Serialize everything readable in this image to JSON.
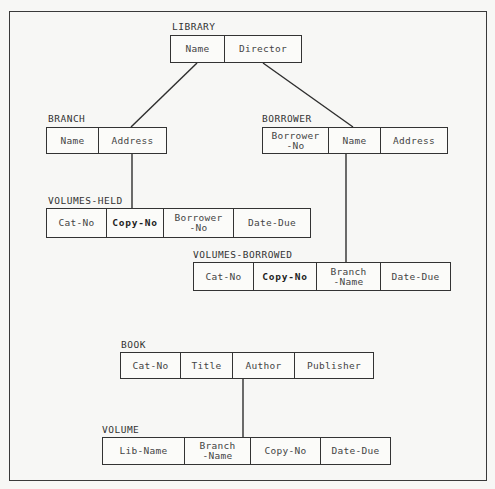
{
  "diagram": {
    "type": "hierarchical relational schema",
    "relations": {
      "library": {
        "name": "LIBRARY",
        "attributes": [
          {
            "label": "Name",
            "key": false
          },
          {
            "label": "Director",
            "key": false
          }
        ]
      },
      "branch": {
        "name": "BRANCH",
        "attributes": [
          {
            "label": "Name",
            "key": false
          },
          {
            "label": "Address",
            "key": false
          }
        ]
      },
      "borrower": {
        "name": "BORROWER",
        "attributes": [
          {
            "label": "Borrower\n-No",
            "key": false
          },
          {
            "label": "Name",
            "key": false
          },
          {
            "label": "Address",
            "key": false
          }
        ]
      },
      "volumes_held": {
        "name": "VOLUMES-HELD",
        "attributes": [
          {
            "label": "Cat-No",
            "key": false
          },
          {
            "label": "Copy-No",
            "key": true
          },
          {
            "label": "Borrower\n-No",
            "key": false
          },
          {
            "label": "Date-Due",
            "key": false
          }
        ]
      },
      "volumes_borrowed": {
        "name": "VOLUMES-BORROWED",
        "attributes": [
          {
            "label": "Cat-No",
            "key": false
          },
          {
            "label": "Copy-No",
            "key": true
          },
          {
            "label": "Branch\n-Name",
            "key": false
          },
          {
            "label": "Date-Due",
            "key": false
          }
        ]
      },
      "book": {
        "name": "BOOK",
        "attributes": [
          {
            "label": "Cat-No",
            "key": false
          },
          {
            "label": "Title",
            "key": false
          },
          {
            "label": "Author",
            "key": false
          },
          {
            "label": "Publisher",
            "key": false
          }
        ]
      },
      "volume": {
        "name": "VOLUME",
        "attributes": [
          {
            "label": "Lib-Name",
            "key": false
          },
          {
            "label": "Branch\n-Name",
            "key": false
          },
          {
            "label": "Copy-No",
            "key": false
          },
          {
            "label": "Date-Due",
            "key": false
          }
        ]
      }
    },
    "edges": [
      {
        "from": "LIBRARY.Name",
        "to": "BRANCH.Address"
      },
      {
        "from": "LIBRARY.Director",
        "to": "BORROWER.Name"
      },
      {
        "from": "BRANCH.Address",
        "to": "VOLUMES-HELD.Copy-No"
      },
      {
        "from": "BORROWER.Name",
        "to": "VOLUMES-BORROWED.Branch-Name"
      },
      {
        "from": "BOOK.Author",
        "to": "VOLUME.Branch-Name"
      }
    ],
    "colors": {
      "line": "#333333",
      "paper": "#f7f7f5"
    }
  }
}
